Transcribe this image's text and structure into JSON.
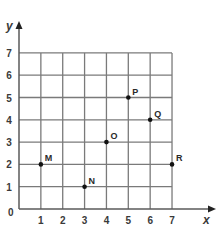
{
  "chart_data": {
    "type": "scatter",
    "title": "",
    "xlabel": "x",
    "ylabel": "y",
    "xlim": [
      0,
      7
    ],
    "ylim": [
      0,
      7
    ],
    "grid": true,
    "x_ticks": [
      "1",
      "2",
      "3",
      "4",
      "5",
      "6",
      "7"
    ],
    "y_ticks": [
      "1",
      "2",
      "3",
      "4",
      "5",
      "6",
      "7"
    ],
    "origin_label": "0",
    "points": [
      {
        "label": "M",
        "x": 1,
        "y": 2
      },
      {
        "label": "N",
        "x": 3,
        "y": 1
      },
      {
        "label": "O",
        "x": 4,
        "y": 3
      },
      {
        "label": "P",
        "x": 5,
        "y": 5
      },
      {
        "label": "Q",
        "x": 6,
        "y": 4
      },
      {
        "label": "R",
        "x": 7,
        "y": 2
      }
    ]
  },
  "colors": {
    "grid": "#7a7a7a",
    "axis": "#5a5a5a",
    "point": "#111111",
    "text": "#3a3a3a"
  }
}
